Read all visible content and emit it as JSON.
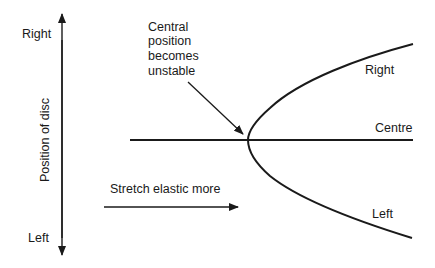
{
  "diagram": {
    "type": "pitchfork-bifurcation",
    "stroke_color": "#1a1a1a",
    "background_color": "#ffffff",
    "vertical_axis": {
      "label": "Position of disc",
      "top_label": "Right",
      "bottom_label": "Left"
    },
    "annotation": {
      "lines": [
        "Central",
        "position",
        "becomes",
        "unstable"
      ]
    },
    "horizontal_arrow": {
      "label": "Stretch elastic more"
    },
    "branches": {
      "upper": "Right",
      "middle": "Centre",
      "lower": "Left"
    }
  }
}
